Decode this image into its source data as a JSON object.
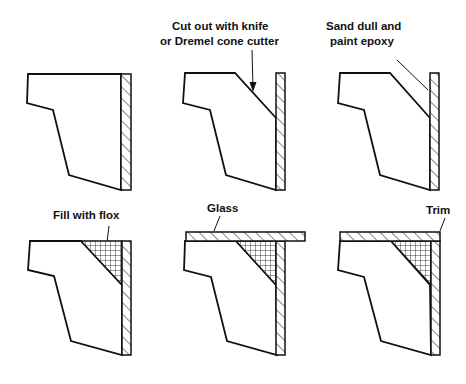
{
  "figure": {
    "background": "#ffffff",
    "ink": "#111111",
    "panels": [
      {
        "id": "step-1",
        "label": ""
      },
      {
        "id": "step-2",
        "label_lines": [
          "Cut out with knife",
          "or Dremel cone cutter"
        ]
      },
      {
        "id": "step-3",
        "label_lines": [
          "Sand dull and",
          "paint epoxy"
        ]
      },
      {
        "id": "step-4",
        "label": "Fill with flox"
      },
      {
        "id": "step-5",
        "label": "Glass"
      },
      {
        "id": "step-6",
        "label": "Trim"
      }
    ]
  }
}
